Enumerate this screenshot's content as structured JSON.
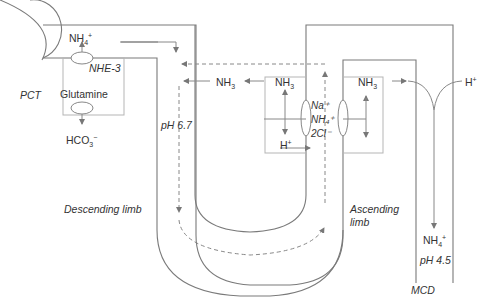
{
  "diagram": {
    "segments": {
      "pct": "PCT",
      "descending_limb": "Descending limb",
      "ascending_limb_line1": "Ascending",
      "ascending_limb_line2": "limb",
      "mcd": "MCD"
    },
    "pct_cell": {
      "nh4": "NH",
      "nh4_sub": "4",
      "nh4_sup": "+",
      "transporter": "NHE-3",
      "substrate": "Glutamine",
      "hco3": "HCO",
      "hco3_sub": "3",
      "hco3_sup": "−"
    },
    "descending": {
      "ph": "pH 6.7",
      "nh3": "NH",
      "nh3_sub": "3"
    },
    "tal_cell": {
      "nh3": "NH",
      "nh3_sub": "3",
      "h": "H",
      "h_sup": "+",
      "cotransporter_line1": "Na⁺",
      "cotransporter_line2": "NH₄⁺",
      "cotransporter_line3": "2Cl⁻"
    },
    "interstitium_cell": {
      "nh3": "NH",
      "nh3_sub": "3"
    },
    "mcd": {
      "h": "H",
      "h_sup": "+",
      "nh4": "NH",
      "nh4_sub": "4",
      "nh4_sup": "+",
      "ph": "pH 4.5"
    },
    "colors": {
      "line": "#7a7a7a",
      "box": "#b5b5b5",
      "text": "#333333"
    }
  }
}
